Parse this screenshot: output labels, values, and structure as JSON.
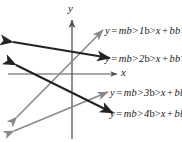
{
  "figure": {
    "background": "#ffffff",
    "axes": {
      "x_label": "x",
      "y_label": "y",
      "color": "#555555",
      "origin": {
        "x": 72,
        "y": 74
      },
      "x_axis_from": {
        "x": 8,
        "y": 74
      },
      "x_axis_to": {
        "x": 119,
        "y": 74
      },
      "y_axis_from": {
        "x": 72,
        "y": 138
      },
      "y_axis_to": {
        "x": 72,
        "y": 18
      }
    },
    "lines": [
      {
        "id": "line-1",
        "label_html": "y = m<sub>1</sub>x + b<sub>1</sub>",
        "equation": "y = m1x + b1",
        "slope_symbol": "m1",
        "intercept_symbol": "b1",
        "color": "#8a8a8a",
        "stroke_width": 1.6,
        "direction": "rising",
        "tail": {
          "x": 17,
          "y": 117
        },
        "head": {
          "x": 103,
          "y": 30
        }
      },
      {
        "id": "line-2",
        "label_html": "y = m<sub>2</sub>x + b<sub>2</sub>",
        "equation": "y = m2x + b2",
        "slope_symbol": "m2",
        "intercept_symbol": "b2",
        "color": "#232323",
        "stroke_width": 2.1,
        "direction": "falling",
        "tail": {
          "x": 13,
          "y": 42
        },
        "head": {
          "x": 110,
          "y": 58
        }
      },
      {
        "id": "line-3",
        "label_html": "y = m<sub>3</sub>x + b<sub>3</sub>",
        "equation": "y = m3x + b3",
        "slope_symbol": "m3",
        "intercept_symbol": "b3",
        "color": "#8a8a8a",
        "stroke_width": 1.6,
        "direction": "rising",
        "tail": {
          "x": 14,
          "y": 131
        },
        "head": {
          "x": 108,
          "y": 92
        }
      },
      {
        "id": "line-4",
        "label_html": "y = m<sub>4</sub>x + b<sub>4</sub>",
        "equation": "y = m4x + b4",
        "slope_symbol": "m4",
        "intercept_symbol": "b4",
        "color": "#232323",
        "stroke_width": 2.1,
        "direction": "falling",
        "tail": {
          "x": 16,
          "y": 65
        },
        "head": {
          "x": 113,
          "y": 113
        }
      }
    ]
  },
  "chart_data": {
    "type": "line",
    "title": "",
    "xlabel": "x",
    "ylabel": "y",
    "grid": false,
    "legend": "inline-right",
    "axis_arrows": [
      "x-positive",
      "y-positive"
    ],
    "xlim": [
      -1,
      1
    ],
    "ylim": [
      -1,
      1
    ],
    "tick_labels": {
      "x": [],
      "y": []
    },
    "series": [
      {
        "name": "y = m1x + b1",
        "color": "#8a8a8a",
        "slope": "m1",
        "intercept": "b1",
        "trend": "positive"
      },
      {
        "name": "y = m2x + b2",
        "color": "#232323",
        "slope": "m2",
        "intercept": "b2",
        "trend": "negative"
      },
      {
        "name": "y = m3x + b3",
        "color": "#8a8a8a",
        "slope": "m3",
        "intercept": "b3",
        "trend": "positive"
      },
      {
        "name": "y = m4x + b4",
        "color": "#232323",
        "slope": "m4",
        "intercept": "b4",
        "trend": "negative"
      }
    ],
    "annotations": [
      "Four doubly-arrowed straight lines drawn on an x-y coordinate plane, each labelled with its slope-intercept equation."
    ]
  }
}
